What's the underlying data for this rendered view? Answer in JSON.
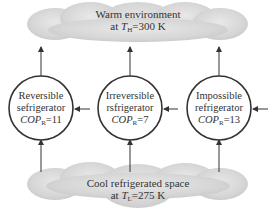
{
  "warm_cloud": {
    "line1": "Warm environment",
    "line2_prefix": "at ",
    "line2_var": "T",
    "line2_sub": "H",
    "line2_suffix": "=300 K"
  },
  "cool_cloud": {
    "line1": "Cool refrigerated space",
    "line2_prefix": "at ",
    "line2_var": "T",
    "line2_sub": "L",
    "line2_suffix": "=275 K"
  },
  "refrigerators": [
    {
      "line1": "Reversible",
      "line2": "sefrigerator",
      "cop_var": "COP",
      "cop_sub": "R",
      "cop_value": "=11"
    },
    {
      "line1": "Irreversible",
      "line2": "rsfrigerator",
      "cop_var": "COP",
      "cop_sub": "R",
      "cop_value": "=7"
    },
    {
      "line1": "Impossible",
      "line2": "refrigerator",
      "cop_var": "COP",
      "cop_sub": "R",
      "cop_value": "=13"
    }
  ],
  "colors": {
    "cloud_fill": "#d9d9d9",
    "line": "#333333",
    "circle_fill": "#ffffff"
  }
}
